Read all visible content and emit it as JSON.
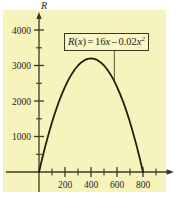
{
  "chart_data": {
    "type": "line",
    "title": "",
    "xlabel": "",
    "ylabel": "R",
    "equation": "R(x) = 16x - 0.02x^2",
    "equation_parts": {
      "lhs_fn": "R",
      "lhs_open": "(",
      "lhs_var": "x",
      "lhs_close": ")",
      "equals": "=",
      "term1_coef": "16",
      "term1_var": "x",
      "minus": "–",
      "term2_coef": "0.02",
      "term2_var": "x",
      "term2_exp": "2"
    },
    "xlim": [
      -40,
      1020
    ],
    "ylim": [
      -420,
      4550
    ],
    "grid": false,
    "legend": null,
    "x_major_ticks": [
      200,
      400,
      600,
      800
    ],
    "x_major_tick_labels": [
      "200",
      "400",
      "600",
      "800"
    ],
    "x_minor_ticks": [
      100,
      300,
      500,
      700,
      900
    ],
    "y_major_ticks": [
      1000,
      2000,
      3000,
      4000
    ],
    "y_major_tick_labels": [
      "1000",
      "2000",
      "3000",
      "4000"
    ],
    "y_minor_ticks": [
      500,
      1500,
      2500,
      3500
    ],
    "roots": [
      0,
      800
    ],
    "vertex": [
      400,
      3200
    ],
    "x": [
      0,
      25,
      50,
      75,
      100,
      125,
      150,
      175,
      200,
      225,
      250,
      275,
      300,
      325,
      350,
      375,
      400,
      425,
      450,
      475,
      500,
      525,
      550,
      575,
      600,
      625,
      650,
      675,
      700,
      725,
      750,
      775,
      800
    ],
    "values": [
      0,
      387.5,
      750,
      1087.5,
      1400,
      1687.5,
      1950,
      2187.5,
      2400,
      2587.5,
      2750,
      2887.5,
      3000,
      3087.5,
      3150,
      3187.5,
      3200,
      3187.5,
      3150,
      3087.5,
      3000,
      2887.5,
      2750,
      2587.5,
      2400,
      2187.5,
      1950,
      1687.5,
      1400,
      1087.5,
      750,
      387.5,
      0
    ],
    "colors": {
      "panel_background": "#f7f3bd",
      "page_background": "#ffffff",
      "curve": "#231f10",
      "axis": "#3a3a22",
      "text": "#272717",
      "annotation_border": "#3a3a22",
      "annotation_background": "#f9f6c8"
    },
    "annotation": {
      "leader_line_from_x": 580,
      "leader_line_to_y": 2700
    }
  }
}
